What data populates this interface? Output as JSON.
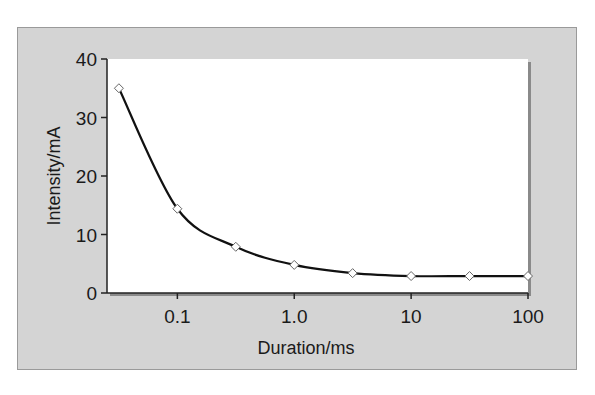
{
  "chart_data": {
    "type": "line",
    "title": "",
    "xlabel": "Duration/ms",
    "ylabel": "Intensity/mA",
    "xscale": "log",
    "xlim": [
      0.025,
      100
    ],
    "ylim": [
      0,
      40
    ],
    "grid": false,
    "legend": null,
    "x_ticks": [
      0.1,
      1.0,
      10,
      100
    ],
    "x_tick_labels": [
      "0.1",
      "1.0",
      "10",
      "100"
    ],
    "y_ticks": [
      0,
      10,
      20,
      30,
      40
    ],
    "y_tick_labels": [
      "0",
      "10",
      "20",
      "30",
      "40"
    ],
    "series": [
      {
        "name": "Strength-duration curve",
        "marker": "open-diamond",
        "x": [
          0.0316,
          0.1,
          0.316,
          1.0,
          3.16,
          10,
          31.6,
          100
        ],
        "y": [
          35,
          14.4,
          7.9,
          4.8,
          3.4,
          2.9,
          2.9,
          2.9
        ]
      }
    ],
    "colors": {
      "panel_background": "#d4d4d4",
      "plot_background": "#ffffff",
      "line": "#111111",
      "marker_fill": "#ffffff"
    }
  }
}
